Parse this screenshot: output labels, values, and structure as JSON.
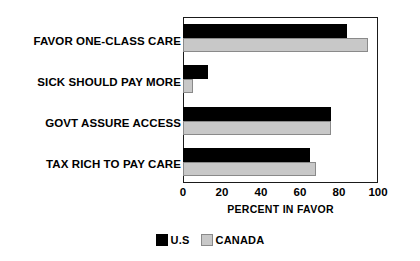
{
  "chart_data": {
    "type": "bar",
    "orientation": "horizontal",
    "title": "",
    "xlabel": "PERCENT IN FAVOR",
    "ylabel": "",
    "xlim": [
      0,
      100
    ],
    "xticks": [
      0,
      20,
      40,
      60,
      80,
      100
    ],
    "grid": false,
    "legend_position": "bottom",
    "categories": [
      "FAVOR ONE-CLASS CARE",
      "SICK SHOULD PAY MORE",
      "GOVT ASSURE ACCESS",
      "TAX RICH TO PAY CARE"
    ],
    "series": [
      {
        "name": "U.S",
        "color": "#000000",
        "values": [
          84,
          13,
          76,
          65
        ]
      },
      {
        "name": "CANADA",
        "color": "#c8c8c8",
        "values": [
          95,
          5,
          76,
          68
        ]
      }
    ]
  },
  "legend": {
    "entries": [
      {
        "label": "U.S",
        "swatch": "black-square-icon"
      },
      {
        "label": "CANADA",
        "swatch": "gray-square-icon"
      }
    ]
  },
  "axis": {
    "tick_labels": [
      "0",
      "20",
      "40",
      "60",
      "80",
      "100"
    ],
    "x_title": "PERCENT IN FAVOR"
  }
}
